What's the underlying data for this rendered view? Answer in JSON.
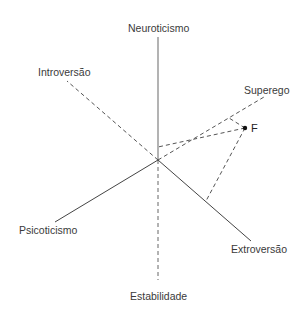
{
  "diagram": {
    "type": "personality-dimensions-axes",
    "center": {
      "x": 158,
      "y": 160
    },
    "axes": [
      {
        "label": "Neuroticismo",
        "style": "solid",
        "end": {
          "x": 158,
          "y": 37
        }
      },
      {
        "label": "Estabilidade",
        "style": "dashed",
        "end": {
          "x": 158,
          "y": 280
        }
      },
      {
        "label": "Introversão",
        "style": "dashed",
        "end": {
          "x": 67,
          "y": 81
        }
      },
      {
        "label": "Extroversão",
        "style": "solid",
        "end": {
          "x": 251,
          "y": 241
        }
      },
      {
        "label": "Psicoticismo",
        "style": "solid",
        "end": {
          "x": 55,
          "y": 222
        }
      },
      {
        "label": "Superego",
        "style": "dashed",
        "end": {
          "x": 264,
          "y": 97
        }
      }
    ],
    "point": {
      "label": "F",
      "x": 245,
      "y": 128
    },
    "projections": [
      {
        "to_axis": "Neuroticismo",
        "foot": {
          "x": 158,
          "y": 147
        }
      },
      {
        "to_axis": "Superego",
        "foot": {
          "x": 229,
          "y": 118
        }
      },
      {
        "to_axis": "Extroversão",
        "foot": {
          "x": 206,
          "y": 201
        }
      }
    ]
  },
  "labels": {
    "neuroticismo": "Neuroticismo",
    "estabilidade": "Estabilidade",
    "introversao": "Introversão",
    "extroversao": "Extroversão",
    "psicoticismo": "Psicoticismo",
    "superego": "Superego",
    "point_f": "F"
  },
  "colors": {
    "solid_axis": "#555555",
    "dashed_axis": "#555555",
    "neuroticismo_axis": "#8a8a8a",
    "point": "#111111",
    "text": "#3a3a3a"
  }
}
